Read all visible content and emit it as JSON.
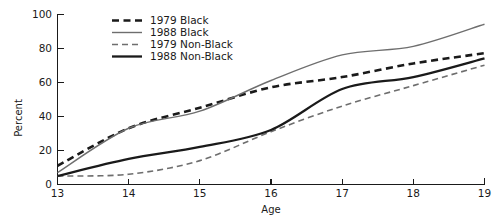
{
  "chart_data": {
    "type": "line",
    "title": "",
    "xlabel": "Age",
    "ylabel": "Percent",
    "xlim": [
      13,
      19
    ],
    "ylim": [
      0,
      100
    ],
    "grid": false,
    "legend_position": "upper-left-inside",
    "x": [
      13,
      14,
      15,
      16,
      17,
      18,
      19
    ],
    "xticks": [
      "13",
      "14",
      "15",
      "16",
      "17",
      "18",
      "19"
    ],
    "yticks": [
      "0",
      "20",
      "40",
      "60",
      "80",
      "100"
    ],
    "series": [
      {
        "name": "1979 Black",
        "style": "dashed",
        "color": "#1a1a1a",
        "width": 2.6,
        "values": [
          11,
          33,
          45,
          57,
          63,
          71,
          77
        ]
      },
      {
        "name": "1988 Black",
        "style": "solid",
        "color": "#6e6e6e",
        "width": 1.4,
        "values": [
          7,
          33,
          43,
          61,
          76,
          81,
          94
        ]
      },
      {
        "name": "1979 Non-Black",
        "style": "dashed",
        "color": "#6e6e6e",
        "width": 1.6,
        "values": [
          5,
          6,
          14,
          31,
          46,
          58,
          70
        ]
      },
      {
        "name": "1988 Non-Black",
        "style": "solid",
        "color": "#1a1a1a",
        "width": 2.3,
        "values": [
          5,
          15,
          22,
          32,
          56,
          63,
          74
        ]
      }
    ]
  },
  "axes": {
    "y_title": "Percent",
    "x_title": "Age",
    "y_tick_0": "0",
    "y_tick_1": "20",
    "y_tick_2": "40",
    "y_tick_3": "60",
    "y_tick_4": "80",
    "y_tick_5": "100",
    "x_tick_0": "13",
    "x_tick_1": "14",
    "x_tick_2": "15",
    "x_tick_3": "16",
    "x_tick_4": "17",
    "x_tick_5": "18",
    "x_tick_6": "19"
  },
  "legend": {
    "entries": [
      {
        "label": "1979 Black"
      },
      {
        "label": "1988 Black"
      },
      {
        "label": "1979 Non-Black"
      },
      {
        "label": "1988 Non-Black"
      }
    ]
  }
}
